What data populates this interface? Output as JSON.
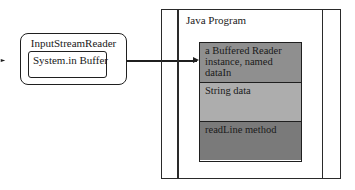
{
  "diagram": {
    "input_stream_reader": {
      "title": "InputStreamReader",
      "buffer_label": "System.in Buffer"
    },
    "java_program": {
      "title": "Java Program",
      "sections": [
        {
          "label": "a Buffered Reader instance, named dataIn",
          "color": "#8f8f8f"
        },
        {
          "label": "String data",
          "color": "#adadad"
        },
        {
          "label": "readLine method",
          "color": "#7a7a7a"
        }
      ]
    },
    "connections": [
      {
        "from": "outside",
        "to": "InputStreamReader",
        "arrow": true
      },
      {
        "from": "System.in Buffer",
        "to": "a Buffered Reader instance, named dataIn",
        "arrow": true
      }
    ]
  }
}
